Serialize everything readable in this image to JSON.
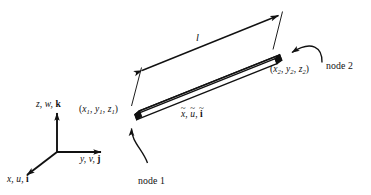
{
  "figure": {
    "name": "three-dimensional-bar-element-diagram",
    "background_color": "#ffffff",
    "line_color": "#111111"
  },
  "global_axes": {
    "z_axis": {
      "label_x": "z,",
      "label_u": "w,",
      "label_vec": "k"
    },
    "y_axis": {
      "label_x": "y,",
      "label_u": "v,",
      "label_vec": "j"
    },
    "x_axis": {
      "label_x": "x,",
      "label_u": "u,",
      "label_vec": "i"
    }
  },
  "local_axis": {
    "x_base": "x",
    "x_accent": "~",
    "u_base": "u",
    "u_accent": "~",
    "i_base": "i",
    "i_accent": "~",
    "sep1": ", ",
    "sep2": ", "
  },
  "node1": {
    "coordinate_label": {
      "open": "(",
      "x": "x",
      "xs": "1",
      "c1": ", ",
      "y": "y",
      "ys": "1",
      "c2": ", ",
      "z": "z",
      "zs": "1",
      "close": ")"
    },
    "callout": "node 1"
  },
  "node2": {
    "coordinate_label": {
      "open": "(",
      "x": "x",
      "xs": "2",
      "c1": ", ",
      "y": "y",
      "ys": "2",
      "c2": ", ",
      "z": "z",
      "zs": "2",
      "close": ")"
    },
    "callout": "node 2"
  },
  "dimension": {
    "length_label": "l"
  }
}
